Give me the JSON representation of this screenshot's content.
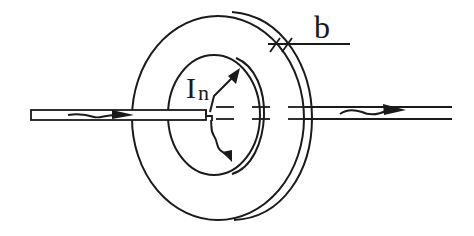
{
  "diagram": {
    "labels": {
      "current": "I",
      "current_subscript": "n",
      "thickness": "b"
    },
    "colors": {
      "line": "#1a1a1a",
      "background": "#ffffff"
    }
  }
}
